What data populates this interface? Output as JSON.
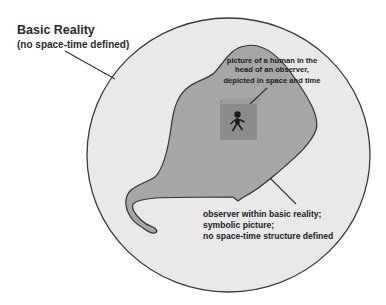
{
  "diagram": {
    "colors": {
      "background": "#ffffff",
      "reality_fill": "#e9e9e9",
      "reality_stroke": "#3a3a3a",
      "observer_fill": "#a6a6a6",
      "observer_stroke": "#333333",
      "picture_box_fill": "#8c8c8c",
      "picture_box_top": "#9e9e9e",
      "human_figure": "#1a1a1a",
      "pointer_line": "#333333",
      "text": "#1e1e1e"
    },
    "basic_reality": {
      "title": "Basic Reality",
      "subtitle": "(no space-time defined)"
    },
    "inner_picture": {
      "lines": [
        "picture of a human in the",
        "head of an observer,",
        "depicted in space and time"
      ]
    },
    "observer": {
      "lines": [
        "observer within basic reality;",
        "symbolic picture;",
        "no space-time structure defined"
      ]
    }
  }
}
